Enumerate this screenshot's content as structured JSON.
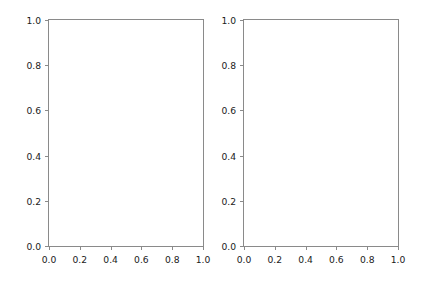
{
  "figure": {
    "width": 421,
    "height": 282,
    "facecolor": "#ffffff",
    "spine_color": "#8a8a8a",
    "tick_label_color": "#1a1a1a"
  },
  "chart_data": [
    {
      "type": "line",
      "title": "",
      "xlabel": "",
      "ylabel": "",
      "xlim": [
        0.0,
        1.0
      ],
      "ylim": [
        0.0,
        1.0
      ],
      "xticks": [
        0.0,
        0.2,
        0.4,
        0.6,
        0.8,
        1.0
      ],
      "yticks": [
        0.0,
        0.2,
        0.4,
        0.6,
        0.8,
        1.0
      ],
      "xticklabels": [
        "0.0",
        "0.2",
        "0.4",
        "0.6",
        "0.8",
        "1.0"
      ],
      "yticklabels": [
        "0.0",
        "0.2",
        "0.4",
        "0.6",
        "0.8",
        "1.0"
      ],
      "grid": false,
      "legend": null,
      "series": [],
      "annotations": []
    },
    {
      "type": "line",
      "title": "",
      "xlabel": "",
      "ylabel": "",
      "xlim": [
        0.0,
        1.0
      ],
      "ylim": [
        0.0,
        1.0
      ],
      "xticks": [
        0.0,
        0.2,
        0.4,
        0.6,
        0.8,
        1.0
      ],
      "yticks": [
        0.0,
        0.2,
        0.4,
        0.6,
        0.8,
        1.0
      ],
      "xticklabels": [
        "0.0",
        "0.2",
        "0.4",
        "0.6",
        "0.8",
        "1.0"
      ],
      "yticklabels": [
        "0.0",
        "0.2",
        "0.4",
        "0.6",
        "0.8",
        "1.0"
      ],
      "grid": false,
      "legend": null,
      "series": [],
      "annotations": []
    }
  ]
}
